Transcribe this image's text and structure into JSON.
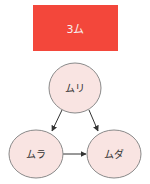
{
  "title": {
    "label": "3ム",
    "color": "#F3473B"
  },
  "nodes": [
    {
      "id": "muri",
      "label": "ムリ",
      "cx": 75,
      "cy": 88,
      "rx": 26,
      "ry": 25
    },
    {
      "id": "mura",
      "label": "ムラ",
      "cx": 36,
      "cy": 154,
      "rx": 27,
      "ry": 24
    },
    {
      "id": "muda",
      "label": "ムダ",
      "cx": 114,
      "cy": 154,
      "rx": 27,
      "ry": 24
    }
  ],
  "edges": [
    {
      "from": "muri",
      "to": "mura"
    },
    {
      "from": "muri",
      "to": "muda"
    },
    {
      "from": "mura",
      "to": "muda"
    }
  ],
  "colors": {
    "node_fill": "#F9E4E2",
    "node_stroke": "#8a8a8a",
    "edge": "#333333"
  }
}
